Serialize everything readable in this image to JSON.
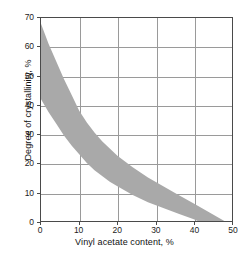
{
  "chart_data": {
    "type": "area",
    "title": "",
    "subtitle": "",
    "xlabel": "Vinyl acetate content, %",
    "ylabel": "Degree of crystallinity, %",
    "xlim": [
      0,
      50
    ],
    "ylim": [
      0,
      70
    ],
    "xticks": [
      0,
      10,
      20,
      30,
      40,
      50
    ],
    "yticks": [
      0,
      10,
      20,
      30,
      40,
      50,
      60,
      70
    ],
    "xtick_labels": [
      "0",
      "10",
      "20",
      "30",
      "40",
      "50"
    ],
    "ytick_labels": [
      "0",
      "10",
      "20",
      "30",
      "40",
      "50",
      "60",
      "70"
    ],
    "grid": true,
    "legend": null,
    "annotations": [],
    "band_color": "#a9a9a9",
    "frame_color": "#4a4a4a",
    "grid_color": "#9a9a9a",
    "background": "#ffffff",
    "series": [
      {
        "name": "Crystallinity band (upper bound)",
        "x": [
          0,
          2,
          4,
          6,
          8,
          10,
          12,
          14,
          16,
          18,
          20,
          24,
          28,
          32,
          36,
          40,
          44,
          48
        ],
        "values": [
          68,
          61,
          55,
          49,
          43.5,
          38,
          34,
          30.5,
          27.5,
          25,
          22.5,
          18.5,
          15,
          12,
          9,
          6,
          3,
          0
        ]
      },
      {
        "name": "Crystallinity band (lower bound)",
        "x": [
          0,
          2,
          4,
          6,
          8,
          10,
          12,
          14,
          16,
          18,
          20,
          24,
          28,
          32,
          36,
          40,
          41
        ],
        "values": [
          42,
          37.5,
          33.5,
          29.5,
          26,
          23,
          20,
          17.5,
          15.5,
          13.5,
          12,
          9,
          6.5,
          4.5,
          2.5,
          0.6,
          0
        ]
      }
    ]
  }
}
